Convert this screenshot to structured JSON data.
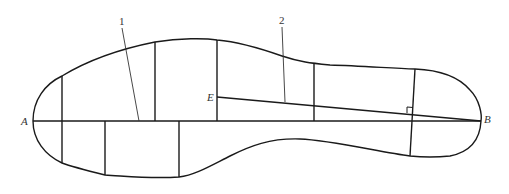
{
  "figure": {
    "type": "insole outline construction diagram",
    "points": {
      "A": {
        "label": "A"
      },
      "B": {
        "label": "B"
      },
      "E": {
        "label": "E"
      }
    },
    "callouts": [
      {
        "label": "1"
      },
      {
        "label": "2"
      }
    ],
    "colors": {
      "stroke": "#1a1a1a",
      "leader": "#333333",
      "background": "#ffffff"
    }
  }
}
